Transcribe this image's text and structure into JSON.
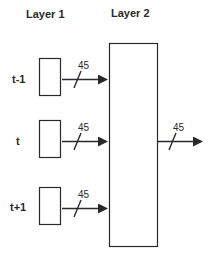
{
  "diagram": {
    "headers": {
      "layer1": "Layer 1",
      "layer2": "Layer 2"
    },
    "inputs": [
      {
        "label": "t-1",
        "width": "45"
      },
      {
        "label": "t",
        "width": "45"
      },
      {
        "label": "t+1",
        "width": "45"
      }
    ],
    "output": {
      "width": "45"
    },
    "colors": {
      "stroke": "#2a2a2a",
      "background": "#ffffff"
    }
  }
}
